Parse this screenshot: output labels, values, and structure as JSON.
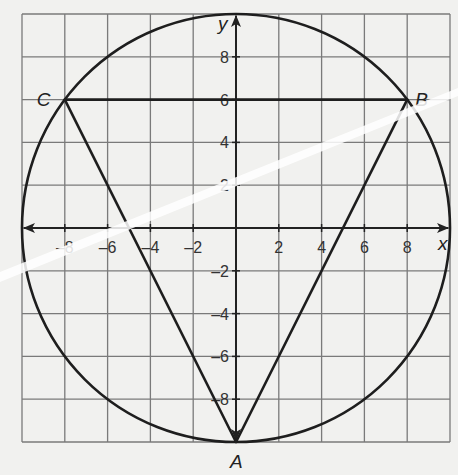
{
  "diagram": {
    "type": "coordinate-plane-inscribed-triangle",
    "x_axis_label": "x",
    "y_axis_label": "y",
    "x_range": [
      -10,
      10
    ],
    "y_range": [
      -10,
      10
    ],
    "grid_step": 2,
    "x_tick_labels": [
      "-8",
      "-6",
      "-4",
      "-2",
      "2",
      "4",
      "6",
      "8"
    ],
    "y_tick_labels": [
      "8",
      "6",
      "4",
      "2",
      "-2",
      "-4",
      "-6",
      "-8"
    ],
    "circle": {
      "center": [
        0,
        0
      ],
      "radius": 10
    },
    "points": [
      {
        "label": "A",
        "coords": [
          0,
          -10
        ]
      },
      {
        "label": "B",
        "coords": [
          8,
          6
        ]
      },
      {
        "label": "C",
        "coords": [
          -8,
          6
        ]
      }
    ],
    "segments": [
      [
        "C",
        "B"
      ],
      [
        "C",
        "A"
      ],
      [
        "B",
        "A"
      ]
    ],
    "colors": {
      "grid": "#7a7a7a",
      "lines": "#1e1e1e",
      "background": "#f1f1ef"
    }
  }
}
